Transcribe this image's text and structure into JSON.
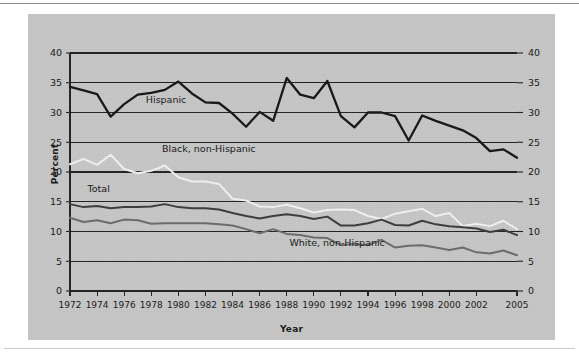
{
  "chart_data": {
    "type": "line",
    "title": "",
    "subtitle": "",
    "xlabel": "Year",
    "ylabel": "Percent",
    "ylim": [
      0,
      40
    ],
    "ytick_step": 5,
    "yticks": [
      0,
      5,
      10,
      15,
      20,
      25,
      30,
      35,
      40
    ],
    "ytick_labels_left": [
      "0",
      "5",
      "10",
      "15",
      "20",
      "25",
      "30",
      "35",
      "40"
    ],
    "ytick_labels_right": [
      "0",
      "5",
      "10",
      "15",
      "20",
      "25",
      "30",
      "35",
      "40"
    ],
    "grid": "horizontal",
    "legend": "inline-labels",
    "xlim": [
      1972,
      2005
    ],
    "x": [
      1972,
      1973,
      1974,
      1975,
      1976,
      1977,
      1978,
      1979,
      1980,
      1981,
      1982,
      1983,
      1984,
      1985,
      1986,
      1987,
      1988,
      1989,
      1990,
      1991,
      1992,
      1993,
      1994,
      1995,
      1996,
      1997,
      1998,
      1999,
      2000,
      2001,
      2002,
      2003,
      2004,
      2005
    ],
    "xtick_labels": [
      "1972",
      "1974",
      "1976",
      "1978",
      "1980",
      "1982",
      "1984",
      "1986",
      "1988",
      "1990",
      "1992",
      "1994",
      "1996",
      "1998",
      "2000",
      "2002",
      "2005"
    ],
    "series": [
      {
        "name": "Hispanic",
        "color": "#1a1a1a",
        "label_x": 1977.6,
        "label_y": 31.6,
        "values": [
          34.3,
          33.7,
          33.1,
          29.3,
          31.4,
          33.0,
          33.3,
          33.8,
          35.2,
          33.2,
          31.7,
          31.6,
          29.8,
          27.6,
          30.1,
          28.6,
          35.8,
          33.0,
          32.4,
          35.3,
          29.4,
          27.5,
          30.0,
          30.0,
          29.4,
          25.3,
          29.5,
          28.6,
          27.8,
          27.0,
          25.7,
          23.5,
          23.8,
          22.4
        ]
      },
      {
        "name": "Black, non-Hispanic",
        "color": "#f2f2f2",
        "label_x": 1978.8,
        "label_y": 23.4,
        "values": [
          21.3,
          22.2,
          21.2,
          22.9,
          20.5,
          19.8,
          20.2,
          21.1,
          19.1,
          18.4,
          18.4,
          18.0,
          15.5,
          15.2,
          14.2,
          14.1,
          14.5,
          13.9,
          13.2,
          13.6,
          13.7,
          13.6,
          12.6,
          12.1,
          13.0,
          13.4,
          13.8,
          12.6,
          13.1,
          10.9,
          11.3,
          10.9,
          11.8,
          10.4
        ]
      },
      {
        "name": "Total",
        "color": "#3f3f3f",
        "label_x": 1973.3,
        "label_y": 16.6,
        "values": [
          14.6,
          14.1,
          14.3,
          13.9,
          14.1,
          14.1,
          14.2,
          14.6,
          14.1,
          13.9,
          13.9,
          13.7,
          13.1,
          12.6,
          12.2,
          12.6,
          12.9,
          12.6,
          12.1,
          12.5,
          11.0,
          11.0,
          11.4,
          12.0,
          11.1,
          11.0,
          11.8,
          11.2,
          10.9,
          10.7,
          10.5,
          9.9,
          10.3,
          9.4
        ]
      },
      {
        "name": "White, non-Hispanic",
        "color": "#6e6e6e",
        "label_x": 1988.2,
        "label_y": 7.6,
        "values": [
          12.3,
          11.6,
          11.9,
          11.4,
          12.0,
          11.9,
          11.3,
          11.4,
          11.4,
          11.4,
          11.4,
          11.2,
          11.0,
          10.4,
          9.7,
          10.4,
          9.6,
          9.4,
          9.0,
          8.9,
          7.7,
          7.9,
          7.7,
          8.6,
          7.3,
          7.6,
          7.7,
          7.3,
          6.9,
          7.3,
          6.5,
          6.3,
          6.8,
          6.0
        ]
      }
    ]
  },
  "axes": {
    "ylabel": "Percent",
    "xlabel": "Year"
  }
}
